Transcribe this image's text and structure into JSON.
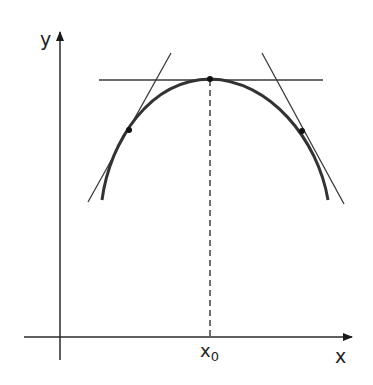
{
  "diagram": {
    "type": "tangent-lines-concave-curve",
    "axes": {
      "x_label": "x",
      "y_label": "y",
      "origin": [
        60,
        337
      ],
      "x_axis": {
        "from": [
          24,
          337
        ],
        "to": [
          354,
          337
        ]
      },
      "y_axis": {
        "from": [
          60,
          360
        ],
        "to": [
          60,
          30
        ]
      }
    },
    "marker": {
      "label_base": "x",
      "label_sub": "0",
      "x": 210,
      "dashed_from_y": 80,
      "dashed_to_y": 337
    },
    "curve": {
      "description": "concave-down arc with maximum at x0",
      "path": "M102,200 C110,140 150,80 210,79 C270,80 318,140 328,200",
      "color": "#333333"
    },
    "points": [
      {
        "name": "left-tangent-point",
        "x": 129,
        "y": 130
      },
      {
        "name": "vertex-point",
        "x": 210,
        "y": 79
      },
      {
        "name": "right-tangent-point",
        "x": 302,
        "y": 131
      }
    ],
    "tangents": [
      {
        "name": "left-tangent",
        "from": [
          88,
          202
        ],
        "to": [
          171,
          53
        ]
      },
      {
        "name": "horizontal-tangent",
        "from": [
          99,
          80
        ],
        "to": [
          323,
          80
        ]
      },
      {
        "name": "right-tangent",
        "from": [
          262,
          53
        ],
        "to": [
          344,
          204
        ]
      }
    ],
    "colors": {
      "axis": "#2a2a2a",
      "curve": "#333333",
      "tangent": "#3a3a3a",
      "point": "#111111",
      "background": "#ffffff"
    }
  }
}
